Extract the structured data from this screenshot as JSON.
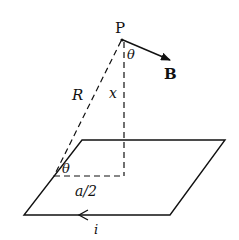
{
  "diagram": {
    "labels": {
      "point": "P",
      "field": "B",
      "distance_slant": "R",
      "distance_vertical": "x",
      "angle_top": "θ",
      "angle_bottom": "θ",
      "half_side": "a/2",
      "current": "i"
    },
    "colors": {
      "line": "#111111",
      "background": "#ffffff"
    }
  }
}
